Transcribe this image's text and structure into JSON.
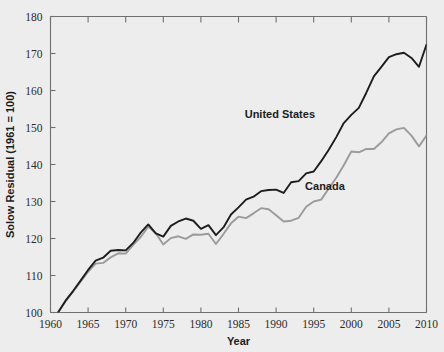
{
  "chart_data": {
    "type": "line",
    "title": "",
    "xlabel": "Year",
    "ylabel": "Solow Residual (1961 = 100)",
    "xlim": [
      1960,
      2010
    ],
    "ylim": [
      100,
      180
    ],
    "grid": false,
    "legend_position": "inline-annotation",
    "xticks": [
      1960,
      1965,
      1970,
      1975,
      1980,
      1985,
      1990,
      1995,
      2000,
      2005,
      2010
    ],
    "yticks": [
      100,
      110,
      120,
      130,
      140,
      150,
      160,
      170,
      180
    ],
    "x": [
      1961,
      1962,
      1963,
      1964,
      1965,
      1966,
      1967,
      1968,
      1969,
      1970,
      1971,
      1972,
      1973,
      1974,
      1975,
      1976,
      1977,
      1978,
      1979,
      1980,
      1981,
      1982,
      1983,
      1984,
      1985,
      1986,
      1987,
      1988,
      1989,
      1990,
      1991,
      1992,
      1993,
      1994,
      1995,
      1996,
      1997,
      1998,
      1999,
      2000,
      2001,
      2002,
      2003,
      2004,
      2005,
      2006,
      2007,
      2008,
      2009,
      2010
    ],
    "series": [
      {
        "name": "United States",
        "color": "#1d1d1d",
        "width": 1.9,
        "values": [
          100.0,
          103.2,
          105.8,
          108.6,
          111.5,
          114.0,
          114.8,
          116.7,
          116.9,
          116.8,
          118.8,
          121.6,
          123.8,
          121.4,
          120.5,
          123.4,
          124.6,
          125.4,
          124.8,
          122.6,
          123.6,
          120.9,
          123.0,
          126.5,
          128.4,
          130.5,
          131.3,
          132.8,
          133.1,
          133.2,
          132.3,
          135.2,
          135.5,
          137.6,
          138.1,
          140.9,
          144.0,
          147.4,
          151.2,
          153.4,
          155.3,
          159.4,
          163.8,
          166.4,
          169.0,
          169.8,
          170.2,
          168.8,
          166.4,
          172.4
        ]
      },
      {
        "name": "Canada",
        "color": "#9a9b9c",
        "width": 1.9,
        "values": [
          100.0,
          103.0,
          105.6,
          108.3,
          111.0,
          113.2,
          113.4,
          114.9,
          116.0,
          115.9,
          118.3,
          120.4,
          123.2,
          121.4,
          118.4,
          120.1,
          120.6,
          119.9,
          121.1,
          121.0,
          121.3,
          118.5,
          121.2,
          124.1,
          125.9,
          125.5,
          126.8,
          128.2,
          127.9,
          126.3,
          124.6,
          124.8,
          125.6,
          128.6,
          130.0,
          130.5,
          133.5,
          136.4,
          139.8,
          143.5,
          143.3,
          144.2,
          144.2,
          146.0,
          148.4,
          149.5,
          149.9,
          147.8,
          144.9,
          147.8
        ]
      }
    ],
    "annotations": [
      {
        "text": "United States",
        "x": 1990.5,
        "y": 152.5
      },
      {
        "text": "Canada",
        "x": 1996.5,
        "y": 133.0
      }
    ]
  }
}
